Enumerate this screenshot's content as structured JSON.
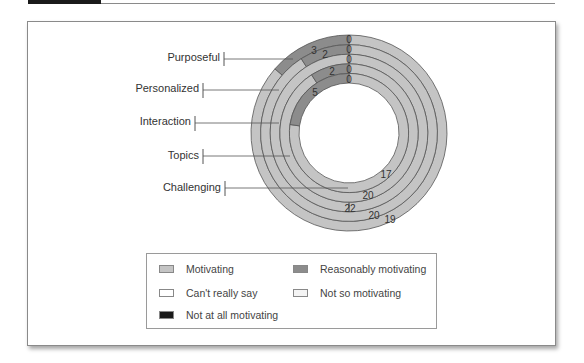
{
  "chart_data": {
    "type": "donut",
    "title": "",
    "rings_outer_to_inner": [
      "Purposeful",
      "Personalized",
      "Interaction",
      "Topics",
      "Challenging"
    ],
    "categories": [
      "Purposeful",
      "Personalized",
      "Interaction",
      "Topics",
      "Challenging"
    ],
    "series": [
      {
        "name": "Motivating",
        "color": "#c4c4c4",
        "values": [
          19,
          20,
          22,
          20,
          17
        ]
      },
      {
        "name": "Reasonably motivating",
        "color": "#8c8c8c",
        "values": [
          3,
          2,
          0,
          2,
          5
        ]
      },
      {
        "name": "Can't really say",
        "color": "#ffffff",
        "values": [
          0,
          0,
          0,
          0,
          0
        ]
      },
      {
        "name": "Not so motivating",
        "color": "#f4f4f4",
        "values": [
          0,
          0,
          0,
          0,
          0
        ]
      },
      {
        "name": "Not at all motivating",
        "color": "#1a1a1a",
        "values": [
          0,
          0,
          0,
          0,
          0
        ]
      }
    ],
    "data_labels": {
      "zero_labels": [
        "0",
        "0",
        "0",
        "0",
        "0"
      ],
      "reasonably": [
        "3",
        "2",
        "",
        "2",
        "5"
      ],
      "motivating": [
        "19",
        "20",
        "22",
        "20",
        "17"
      ]
    },
    "legend_position": "bottom"
  },
  "labels": {
    "purposeful": "Purposeful",
    "personalized": "Personalized",
    "interaction": "Interaction",
    "topics": "Topics",
    "challenging": "Challenging"
  },
  "legend": {
    "items": [
      {
        "label": "Motivating",
        "color": "#c4c4c4"
      },
      {
        "label": "Reasonably motivating",
        "color": "#8c8c8c"
      },
      {
        "label": "Can't really say",
        "color": "#ffffff"
      },
      {
        "label": "Not so motivating",
        "color": "#f4f4f4"
      },
      {
        "label": "Not at all motivating",
        "color": "#1a1a1a"
      }
    ]
  },
  "values": {
    "r1_reason": "3",
    "r2_reason": "2",
    "r4_reason": "2",
    "r5_reason": "5",
    "zero": "0",
    "r1_motiv": "19",
    "r2_motiv": "20",
    "r3_motiv": "22",
    "r4_motiv": "20",
    "r5_motiv": "17"
  }
}
